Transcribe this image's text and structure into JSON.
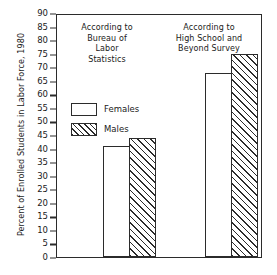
{
  "chart_data": {
    "type": "bar",
    "title": "",
    "xlabel": "",
    "ylabel": "Percent of Enrolled Students in Labor Force, 1980",
    "ylim": [
      0,
      90
    ],
    "yticks": [
      0,
      5,
      10,
      15,
      20,
      25,
      30,
      35,
      40,
      45,
      50,
      55,
      60,
      65,
      70,
      75,
      80,
      85,
      90
    ],
    "grid": false,
    "legend_position": "upper-left-inside",
    "categories": [
      "According to Bureau of Labor Statistics",
      "According to High School and Beyond Survey"
    ],
    "series": [
      {
        "name": "Females",
        "values": [
          41,
          68
        ],
        "fill": "white"
      },
      {
        "name": "Males",
        "values": [
          44,
          75
        ],
        "fill": "hatched"
      }
    ]
  },
  "panels": {
    "left_title": "According to\nBureau of\nLabor\nStatistics",
    "right_title": "According to\nHigh School and\nBeyond Survey"
  },
  "legend": {
    "items": [
      {
        "label": "Females",
        "fill": "white"
      },
      {
        "label": "Males",
        "fill": "hatched"
      }
    ]
  },
  "colors": {
    "ink": "#2b2b2b",
    "background": "#ffffff"
  }
}
